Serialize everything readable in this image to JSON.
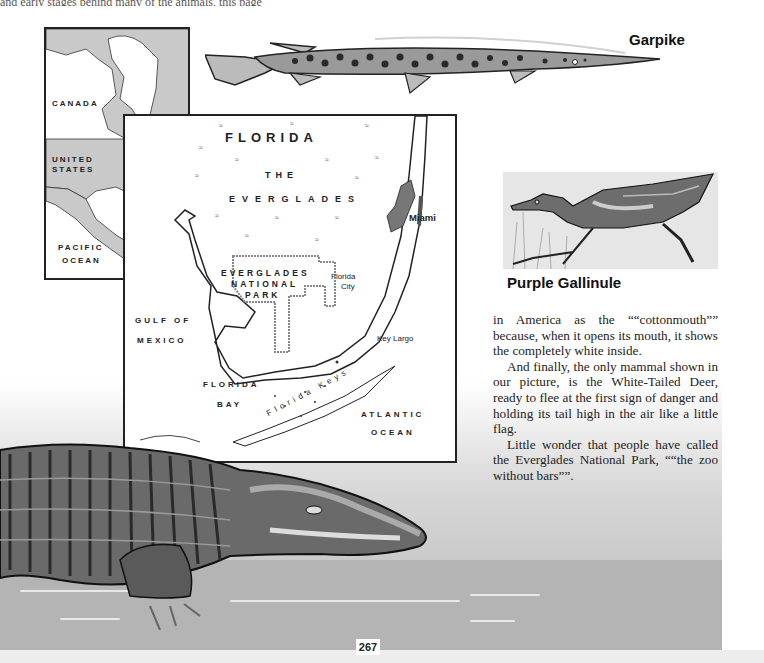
{
  "page": {
    "top_cutoff_text": "and early stages behind many of the animals, this page",
    "page_number": "267"
  },
  "captions": {
    "garpike": "Garpike",
    "purple_gallinule": "Purple Gallinule"
  },
  "inset_map": {
    "labels": {
      "canada": "CANADA",
      "united_states_1": "UNITED",
      "united_states_2": "STATES",
      "ottawa": "Ottawa",
      "washington": "Washington",
      "florida": "FLORIDA",
      "west_indies_1": "WEST",
      "west_indies_2": "INDIES",
      "pacific_1": "PACIFIC",
      "pacific_2": "OCEAN",
      "south_america_1": "SOUTH",
      "south_america_2": "AMERICA"
    },
    "colors": {
      "land": "#c9c9c9",
      "water": "#ffffff",
      "border": "#222222"
    }
  },
  "florida_map": {
    "labels": {
      "title": "FLORIDA",
      "the": "THE",
      "everglades": "EVERGLADES",
      "park_1": "EVERGLADES",
      "park_2": "NATIONAL",
      "park_3": "PARK",
      "florida_city_1": "Florida",
      "florida_city_2": "City",
      "miami": "Miami",
      "key_largo": "Key Largo",
      "gulf_1": "GULF OF",
      "gulf_2": "MEXICO",
      "bay_1": "FLORIDA",
      "bay_2": "BAY",
      "keys": "Florida Keys",
      "atlantic_1": "ATLANTIC",
      "atlantic_2": "OCEAN"
    },
    "marsh_symbol": "≈"
  },
  "body_text": {
    "paragraphs": [
      "in America as the ““cottonmouth”” because, when it opens its mouth, it shows the completely white inside.",
      "And finally, the only mammal shown in our picture, is the White-Tailed Deer, ready to flee at the first sign of danger and holding its tail high in the air like a little flag.",
      "Little wonder that people have called the Everglades National Park, ““the zoo without bars””."
    ]
  },
  "illustrations": {
    "fish": "garpike-illustration",
    "bird": "gallinule-illustration",
    "reptile": "alligator-illustration"
  }
}
